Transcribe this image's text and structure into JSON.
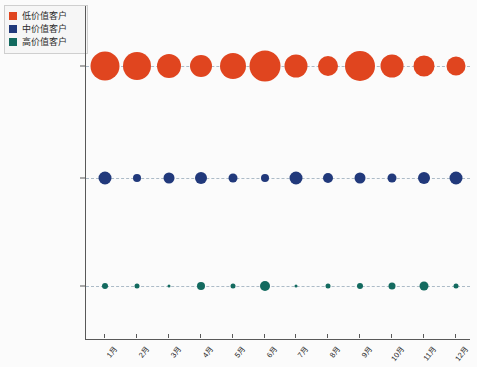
{
  "legend": {
    "position": "top-left",
    "items": [
      {
        "label": "低价值客户",
        "color": "#E0451F",
        "icon": "square-swatch"
      },
      {
        "label": "中价值客户",
        "color": "#21397B",
        "icon": "square-swatch"
      },
      {
        "label": "高价值客户",
        "color": "#136A5F",
        "icon": "square-swatch"
      }
    ]
  },
  "axis": {
    "y_labels": [
      "低价值客户",
      "中价值客户",
      "高价值客户"
    ],
    "x_labels": [
      "1月",
      "2月",
      "3月",
      "4月",
      "5月",
      "6月",
      "7月",
      "8月",
      "9月",
      "10月",
      "11月",
      "12月"
    ]
  },
  "chart_data": {
    "type": "scatter",
    "title": "",
    "subtitle": "",
    "xlabel": "",
    "ylabel": "",
    "grid": false,
    "legend_position": "top-left",
    "categories": [
      "1月",
      "2月",
      "3月",
      "4月",
      "5月",
      "6月",
      "7月",
      "8月",
      "9月",
      "10月",
      "11月",
      "12月"
    ],
    "y_categories": [
      "低价值客户",
      "中价值客户",
      "高价值客户"
    ],
    "series": [
      {
        "name": "低价值客户",
        "color": "#E0451F",
        "y_row": 0,
        "values": [
          29,
          28,
          24,
          22,
          26,
          31,
          23,
          20,
          30,
          23,
          21,
          19
        ]
      },
      {
        "name": "中价值客户",
        "color": "#21397B",
        "y_row": 1,
        "values": [
          13,
          8,
          11,
          12,
          9,
          8,
          13,
          10,
          11,
          9,
          12,
          13
        ]
      },
      {
        "name": "高价值客户",
        "color": "#136A5F",
        "y_row": 2,
        "values": [
          6,
          5,
          3,
          8,
          5,
          10,
          3,
          5,
          6,
          7,
          9,
          5
        ]
      }
    ]
  },
  "style": {
    "background": "#fbfbfb",
    "axis_color": "#595959",
    "connector_color": "#9fb0bf",
    "connector_style": "dashed"
  }
}
